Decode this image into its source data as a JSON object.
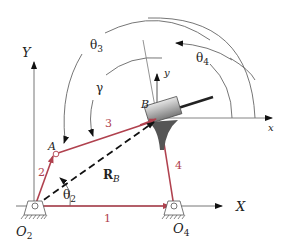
{
  "diagram": {
    "type": "four-bar linkage with slider (inverted slider-crank)",
    "colors": {
      "link": "#b0414e",
      "axis": "#555555",
      "arc": "#666666",
      "text": "#222222",
      "block": "#9a9a9a"
    },
    "labels": {
      "global_y_axis": "Y",
      "global_x_axis": "X",
      "local_y_axis": "y",
      "local_x_axis": "x",
      "pivot_O2": "O",
      "pivot_O2_sub": "2",
      "pivot_O4": "O",
      "pivot_O4_sub": "4",
      "point_A": "A",
      "point_B": "B",
      "link_1": "1",
      "link_2": "2",
      "link_3": "3",
      "link_4": "4",
      "vector_RB": "R",
      "vector_RB_sub": "B",
      "theta2": "θ",
      "theta2_sub": "2",
      "theta3": "θ",
      "theta3_sub": "3",
      "theta4": "θ",
      "theta4_sub": "4",
      "gamma": "γ"
    }
  }
}
